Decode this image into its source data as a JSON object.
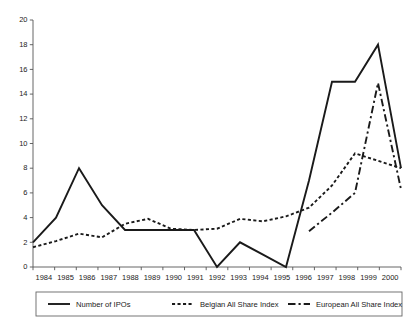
{
  "chart_data": {
    "type": "line",
    "title": "",
    "subtitle": "",
    "xlabel": "",
    "ylabel": "",
    "x": [
      1984,
      1985,
      1986,
      1987,
      1988,
      1989,
      1990,
      1991,
      1992,
      1993,
      1994,
      1995,
      1996,
      1997,
      1998,
      1999,
      2000
    ],
    "categories": [
      "1984",
      "1985",
      "1986",
      "1987",
      "1988",
      "1989",
      "1990",
      "1991",
      "1992",
      "1993",
      "1994",
      "1995",
      "1996",
      "1997",
      "1998",
      "1999",
      "2000"
    ],
    "xlim": [
      1984,
      2000
    ],
    "ylim": [
      0,
      20
    ],
    "yticks": [
      0,
      2,
      4,
      6,
      8,
      10,
      12,
      14,
      16,
      18,
      20
    ],
    "ytick_labels": [
      "0",
      "2",
      "4",
      "6",
      "8",
      "10",
      "12",
      "14",
      "16",
      "18",
      "20"
    ],
    "grid": false,
    "legend_position": "bottom",
    "series": [
      {
        "name": "Number of IPOs",
        "style": "solid",
        "color": "#1a1a1a",
        "values": [
          2,
          4,
          8,
          5,
          3,
          3,
          3,
          3,
          0,
          2,
          1,
          0,
          7,
          15,
          15,
          18,
          8
        ]
      },
      {
        "name": "Belgian All Share Index",
        "style": "dotted",
        "color": "#1a1a1a",
        "values": [
          1.6,
          2.1,
          2.7,
          2.4,
          3.5,
          3.9,
          3.1,
          3.0,
          3.1,
          3.9,
          3.7,
          4.1,
          4.8,
          6.6,
          9.2,
          8.6,
          8.0
        ]
      },
      {
        "name": "European All Share Index",
        "style": "dash-dot",
        "color": "#1a1a1a",
        "values": [
          null,
          null,
          null,
          null,
          null,
          null,
          null,
          null,
          null,
          null,
          null,
          null,
          2.9,
          4.4,
          6.0,
          14.9,
          6.3
        ]
      }
    ]
  },
  "legend": {
    "items": [
      {
        "label": "Number of IPOs",
        "style": "solid"
      },
      {
        "label": "Belgian All Share Index",
        "style": "dotted"
      },
      {
        "label": "European All Share Index",
        "style": "dash-dot"
      }
    ]
  },
  "axes": {
    "y_ticks": [
      "20",
      "18",
      "16",
      "14",
      "12",
      "10",
      "8",
      "6",
      "4",
      "2",
      "0"
    ],
    "x_ticks": [
      "1984",
      "1985",
      "1986",
      "1987",
      "1988",
      "1989",
      "1990",
      "1991",
      "1992",
      "1993",
      "1994",
      "1995",
      "1996",
      "1997",
      "1998",
      "1999",
      "2000"
    ]
  }
}
